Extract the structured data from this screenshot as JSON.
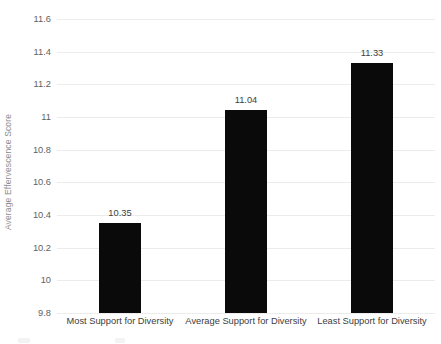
{
  "chart_data": {
    "type": "bar",
    "title": "",
    "subtitle": "",
    "xlabel": "",
    "ylabel": "Average Effervescence Score",
    "categories": [
      "Most Support for Diversity",
      "Average Support for Diversity",
      "Least Support for Diversity"
    ],
    "values": [
      10.35,
      11.04,
      11.33
    ],
    "data_labels": [
      "10.35",
      "11.04",
      "11.33"
    ],
    "ylim": [
      9.8,
      11.6
    ],
    "ytick_labels": [
      "11.6",
      "11.4",
      "11.2",
      "11",
      "10.8",
      "10.6",
      "10.4",
      "10.2",
      "10",
      "9.8"
    ],
    "ytick_values": [
      11.6,
      11.4,
      11.2,
      11,
      10.8,
      10.6,
      10.4,
      10.2,
      10,
      9.8
    ],
    "grid": true,
    "grid_axis": "y",
    "legend": false,
    "legend_position": "none",
    "series": [
      {
        "name": "Average Effervescence Score",
        "values": [
          10.35,
          11.04,
          11.33
        ],
        "color": "#0a0a0a"
      }
    ],
    "colors": {
      "background": "#ffffff",
      "bar": "#0a0a0a",
      "gridline": "#ececec",
      "tick_text": "#5f5f5f",
      "axis_title_text": "#8d8d8d",
      "data_label_text": "#3d3d3d"
    }
  }
}
